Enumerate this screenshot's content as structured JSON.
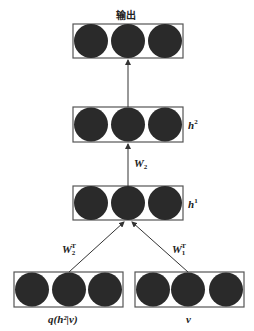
{
  "diagram": {
    "title": "输出",
    "layers": [
      {
        "id": "output",
        "label": "",
        "units": 3
      },
      {
        "id": "h2",
        "label_base": "h",
        "label_sup": "2",
        "units": 3
      },
      {
        "id": "h1",
        "label_base": "h",
        "label_sup": "1",
        "units": 3
      },
      {
        "id": "q",
        "label": "q(h²|v)",
        "units": 3
      },
      {
        "id": "v",
        "label": "v",
        "units": 3
      }
    ],
    "edges": [
      {
        "from": "h2",
        "to": "output",
        "label": ""
      },
      {
        "from": "h1",
        "to": "h2",
        "label_base": "W",
        "label_sub": "2"
      },
      {
        "from": "q",
        "to": "h1",
        "label_base": "W",
        "label_sub": "2",
        "label_sup": "T"
      },
      {
        "from": "v",
        "to": "h1",
        "label_base": "W",
        "label_sub": "1",
        "label_sup": "T"
      }
    ],
    "colors": {
      "unit": "#2a2a2a",
      "box": "#555555",
      "arrow": "#333333"
    }
  }
}
